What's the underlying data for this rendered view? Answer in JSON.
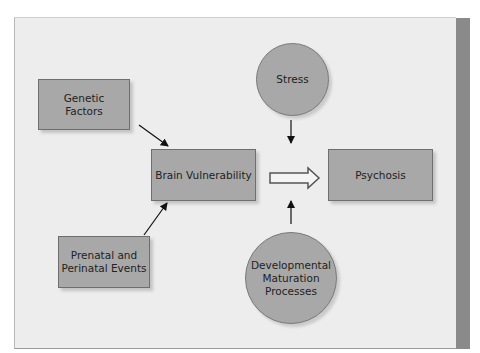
{
  "diagram": {
    "nodes": {
      "genetic": {
        "label": "Genetic\nFactors",
        "shape": "box"
      },
      "prenatal": {
        "label": "Prenatal and\nPerinatal Events",
        "shape": "box"
      },
      "brain": {
        "label": "Brain Vulnerability",
        "shape": "box"
      },
      "psychosis": {
        "label": "Psychosis",
        "shape": "box"
      },
      "stress": {
        "label": "Stress",
        "shape": "circle"
      },
      "developmental": {
        "label": "Developmental\nMaturation\nProcesses",
        "shape": "circle"
      }
    },
    "edges": [
      {
        "from": "Genetic Factors",
        "to": "Brain Vulnerability",
        "style": "arrow"
      },
      {
        "from": "Prenatal and Perinatal Events",
        "to": "Brain Vulnerability",
        "style": "arrow"
      },
      {
        "from": "Brain Vulnerability",
        "to": "Psychosis",
        "style": "hollow-block-arrow"
      },
      {
        "from": "Stress",
        "to": "Brain Vulnerability → Psychosis",
        "style": "arrow-down"
      },
      {
        "from": "Developmental Maturation Processes",
        "to": "Brain Vulnerability → Psychosis",
        "style": "arrow-up"
      }
    ],
    "colors": {
      "panel_bg": "#ededed",
      "node_fill": "#a8a8a8",
      "node_border": "#6e6e6e",
      "side_strip": "#8a8a8a",
      "arrow": "#111111"
    }
  }
}
